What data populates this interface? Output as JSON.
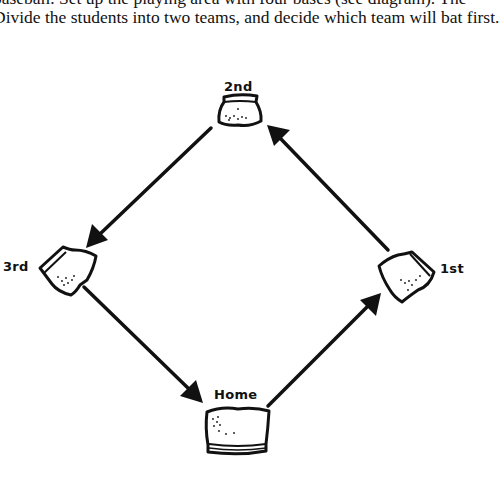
{
  "document": {
    "lines": [
      "baseball.  Set up the playing area with four bases (see diagram).  The",
      "Divide the students into two teams, and decide which team will bat first."
    ]
  },
  "diagram": {
    "type": "baseball-diamond",
    "bases": {
      "second": "2nd",
      "third": "3rd",
      "first": "1st",
      "home": "Home"
    },
    "arrows": [
      {
        "from": "2nd",
        "to": "3rd"
      },
      {
        "from": "3rd",
        "to": "Home"
      },
      {
        "from": "Home",
        "to": "1st"
      },
      {
        "from": "1st",
        "to": "2nd"
      }
    ],
    "stroke_color": "#111111"
  }
}
